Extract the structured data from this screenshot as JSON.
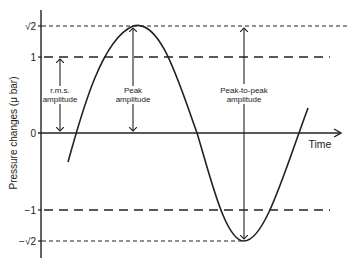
{
  "diagram": {
    "y_axis_label": "Pressure changes (μ bar)",
    "x_axis_label": "Time",
    "y_ticks": [
      {
        "label": "√2",
        "value": 1.414
      },
      {
        "label": "1",
        "value": 1
      },
      {
        "label": "0",
        "value": 0
      },
      {
        "label": "−1",
        "value": -1
      },
      {
        "label": "−√2",
        "value": -1.414
      }
    ],
    "annotations": {
      "rms": {
        "line1": "r.m.s.",
        "line2": "amplitude"
      },
      "peak": {
        "line1": "Peak",
        "line2": "amplitude"
      },
      "peak_to_peak": {
        "line1": "Peak-to-peak",
        "line2": "amplitude"
      }
    },
    "colors": {
      "ink": "#222222",
      "background": "#ffffff"
    }
  }
}
